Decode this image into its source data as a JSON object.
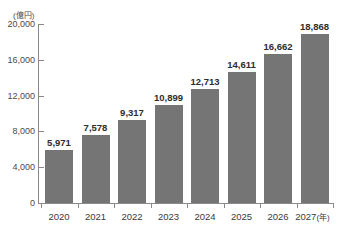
{
  "chart_data": {
    "type": "bar",
    "title": "",
    "subtitle": "",
    "unit_caption": "(億円)",
    "xlabel": "(年)",
    "ylabel": "",
    "categories": [
      "2020",
      "2021",
      "2022",
      "2023",
      "2024",
      "2025",
      "2026",
      "2027"
    ],
    "values": [
      5971,
      7578,
      9317,
      10899,
      12713,
      14611,
      16662,
      18868
    ],
    "value_labels": [
      "5,971",
      "7,578",
      "9,317",
      "10,899",
      "12,713",
      "14,611",
      "16,662",
      "18,868"
    ],
    "ylim": [
      0,
      20000
    ],
    "yticks": [
      0,
      4000,
      8000,
      12000,
      16000,
      20000
    ],
    "ytick_labels": [
      "0",
      "4,000",
      "8,000",
      "12,000",
      "16,000",
      "20,000"
    ],
    "grid": false,
    "legend": null,
    "bar_color": "#757575",
    "axis_color": "#8a8a8a",
    "background_color": "#ffffff",
    "last_category_suffix": "(年)"
  }
}
